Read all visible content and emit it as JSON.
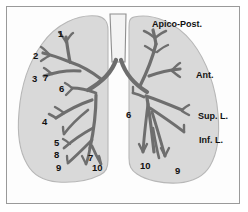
{
  "figure": {
    "background_color": "#ffffff",
    "frame_color": "#9a9a9a",
    "lung_fill_color": "#d9d9d9",
    "lung_outline_color": "#b3b3b3",
    "bronchus_color": "#6e6e6e",
    "bronchus_outline_color": "#3a3a3a",
    "trachea_color": "#f4f4f4",
    "label_color": "#111111"
  },
  "left_lung": {
    "name": "right-lung-as-drawn-left-side",
    "segment_numbers": [
      {
        "id": "l1",
        "text": "1",
        "x": 58,
        "y": 29
      },
      {
        "id": "l2",
        "text": "2",
        "x": 33,
        "y": 51
      },
      {
        "id": "l3",
        "text": "3",
        "x": 32,
        "y": 74
      },
      {
        "id": "l7",
        "text": "7",
        "x": 43,
        "y": 73
      },
      {
        "id": "l6",
        "text": "6",
        "x": 59,
        "y": 84
      },
      {
        "id": "l4",
        "text": "4",
        "x": 42,
        "y": 117
      },
      {
        "id": "l5",
        "text": "5",
        "x": 54,
        "y": 138
      },
      {
        "id": "l8",
        "text": "8",
        "x": 54,
        "y": 150
      },
      {
        "id": "l9",
        "text": "9",
        "x": 56,
        "y": 163
      },
      {
        "id": "l7b",
        "text": "7",
        "x": 88,
        "y": 153
      },
      {
        "id": "l10",
        "text": "10",
        "x": 92,
        "y": 163
      }
    ]
  },
  "right_lung": {
    "name": "left-lung-as-drawn-right-side",
    "segment_numbers": [
      {
        "id": "r6",
        "text": "6",
        "x": 126,
        "y": 110
      },
      {
        "id": "r10",
        "text": "10",
        "x": 140,
        "y": 161
      },
      {
        "id": "r9",
        "text": "9",
        "x": 175,
        "y": 166
      }
    ],
    "text_labels": [
      {
        "id": "apico-post",
        "text": "Apico-Post.",
        "x": 152,
        "y": 20
      },
      {
        "id": "ant",
        "text": "Ant.",
        "x": 196,
        "y": 71
      },
      {
        "id": "sup-l",
        "text": "Sup. L.",
        "x": 198,
        "y": 112
      },
      {
        "id": "inf-l",
        "text": "Inf. L.",
        "x": 199,
        "y": 136
      }
    ]
  }
}
